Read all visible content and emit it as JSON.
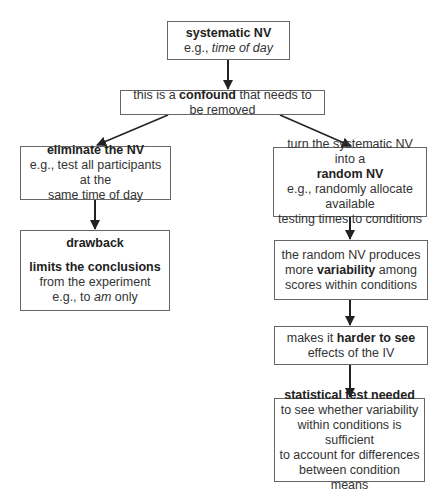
{
  "diagram": {
    "type": "flowchart",
    "colors": {
      "border": "#666666",
      "text": "#333333",
      "arrow": "#222222",
      "background": "#ffffff"
    },
    "nodes": {
      "systematic": {
        "title": "systematic NV",
        "example_prefix": "e.g., ",
        "example_italic": "time of day"
      },
      "confound": {
        "pre": "this is a ",
        "bold": "confound",
        "post": " that needs to be removed"
      },
      "eliminate": {
        "title": "eliminate the NV",
        "line1": "e.g., test all participants at the",
        "line2": "same time of day"
      },
      "drawback": {
        "title": "drawback",
        "bold": "limits the conclusions",
        "line1": "from the experiment",
        "line2_prefix": "e.g., to ",
        "line2_italic": "am",
        "line2_suffix": " only"
      },
      "randomize": {
        "line1": "turn the systematic NV into a",
        "bold": "random NV",
        "line2": "e.g., randomly allocate available",
        "line3": "testing times to conditions"
      },
      "variability": {
        "line1": "the random NV produces",
        "pre": "more ",
        "bold": "variability",
        "post": " among",
        "line3": "scores within conditions"
      },
      "harder": {
        "pre": "makes it ",
        "bold": "harder to see",
        "line2": "effects of the IV"
      },
      "stat_test": {
        "title": "statistical test needed",
        "line1": "to see whether variability",
        "line2": "within conditions is sufficient",
        "line3": "to account for differences",
        "line4": "between condition means"
      }
    },
    "edges": [
      [
        "systematic",
        "confound"
      ],
      [
        "confound",
        "eliminate"
      ],
      [
        "confound",
        "randomize"
      ],
      [
        "eliminate",
        "drawback"
      ],
      [
        "randomize",
        "variability"
      ],
      [
        "variability",
        "harder"
      ],
      [
        "harder",
        "stat_test"
      ]
    ]
  }
}
